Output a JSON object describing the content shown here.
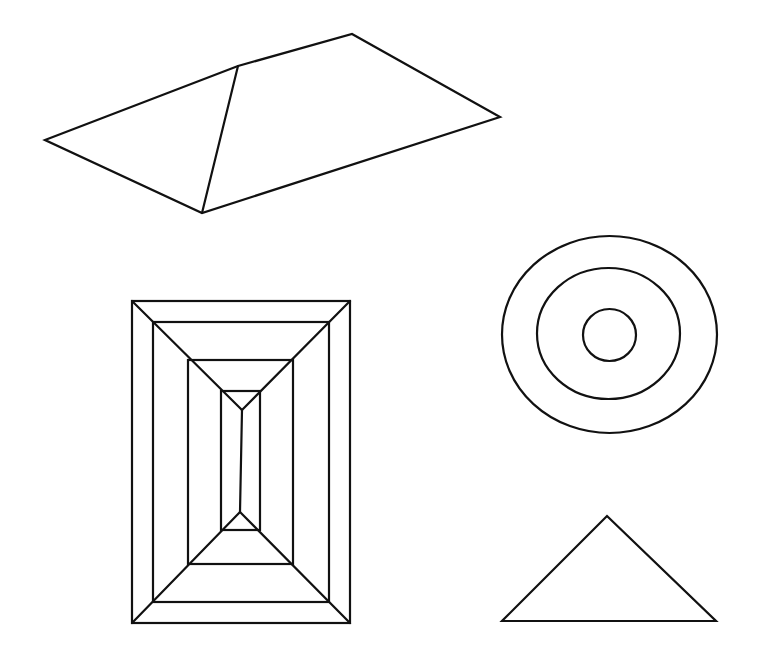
{
  "canvas": {
    "width": 758,
    "height": 663,
    "background": "#ffffff",
    "stroke_color": "#111111",
    "stroke_width": 2.2
  },
  "figures": {
    "roof_shape": {
      "label": "hip-roof quadrilateral",
      "outline": "45,140 238,66 352,34 500,117 202,213",
      "ridge_line": {
        "x1": 238,
        "y1": 66,
        "x2": 202,
        "y2": 213
      }
    },
    "nested_rectangles": {
      "label": "nested rectangles with diagonals",
      "rects": [
        {
          "x": 132,
          "y": 301,
          "w": 218,
          "h": 322
        },
        {
          "x": 153,
          "y": 322,
          "w": 176,
          "h": 280
        },
        {
          "x": 188,
          "y": 360,
          "w": 105,
          "h": 204
        },
        {
          "x": 221,
          "y": 391,
          "w": 39,
          "h": 139
        }
      ],
      "top_apex": {
        "x": 242,
        "y": 410
      },
      "bottom_apex": {
        "x": 240,
        "y": 512
      },
      "diagonals": [
        {
          "x1": 132,
          "y1": 301,
          "x2": 242,
          "y2": 410
        },
        {
          "x1": 350,
          "y1": 301,
          "x2": 242,
          "y2": 410
        },
        {
          "x1": 132,
          "y1": 623,
          "x2": 240,
          "y2": 512
        },
        {
          "x1": 350,
          "y1": 623,
          "x2": 240,
          "y2": 512
        },
        {
          "x1": 242,
          "y1": 410,
          "x2": 240,
          "y2": 512
        }
      ]
    },
    "concentric_circles": {
      "label": "concentric ellipses",
      "ellipses": [
        {
          "cx": 609.5,
          "cy": 334.5,
          "rx": 107.5,
          "ry": 98.5
        },
        {
          "cx": 608.5,
          "cy": 333.5,
          "rx": 71.5,
          "ry": 65.5
        },
        {
          "cx": 609.5,
          "cy": 335,
          "rx": 26.5,
          "ry": 26
        }
      ]
    },
    "triangle": {
      "label": "isosceles triangle",
      "points": "607,516 716,621 502,621"
    }
  }
}
